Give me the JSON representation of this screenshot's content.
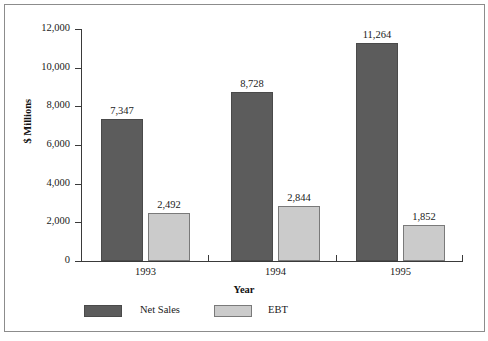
{
  "chart_data": {
    "type": "bar",
    "title": "",
    "xlabel": "Year",
    "ylabel": "$ Millions",
    "categories": [
      "1993",
      "1994",
      "1995"
    ],
    "series": [
      {
        "name": "Net Sales",
        "color": "#5c5c5c",
        "values": [
          7347,
          8728,
          11264
        ],
        "value_labels": [
          "7,347",
          "8,728",
          "11,264"
        ]
      },
      {
        "name": "EBT",
        "color": "#cbcbcb",
        "values": [
          2492,
          2844,
          1852
        ],
        "value_labels": [
          "2,492",
          "2,844",
          "1,852"
        ]
      }
    ],
    "ylim": [
      0,
      12000
    ],
    "ytick_values": [
      0,
      2000,
      4000,
      6000,
      8000,
      10000,
      12000
    ],
    "ytick_labels": [
      "0",
      "2,000",
      "4,000",
      "6,000",
      "8,000",
      "10,000",
      "12,000"
    ],
    "grid": false,
    "legend_position": "bottom-left"
  },
  "legend": {
    "entries": [
      {
        "label": "Net Sales",
        "color": "#5c5c5c"
      },
      {
        "label": "EBT",
        "color": "#cbcbcb"
      }
    ]
  },
  "colors": {
    "net_sales": "#5c5c5c",
    "ebt": "#cbcbcb",
    "axis": "#3a3a3a",
    "frame": "#8c8c8c",
    "text": "#1a1a1a"
  }
}
